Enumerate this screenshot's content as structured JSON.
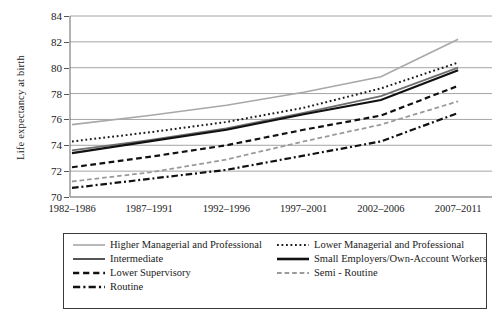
{
  "chart_data": {
    "type": "line",
    "title": "",
    "xlabel": "",
    "ylabel": "Life expectancy at birth",
    "categories": [
      "1982–1986",
      "1987–1991",
      "1992–1996",
      "1997–2001",
      "2002–2006",
      "2007–2011"
    ],
    "ylim": [
      70,
      84
    ],
    "yticks": [
      70,
      72,
      74,
      76,
      78,
      80,
      82,
      84
    ],
    "grid": true,
    "legend_position": "bottom",
    "series": [
      {
        "name": "Higher Managerial and Professional",
        "style": "solid",
        "color": "#a8a8a8",
        "width": 1.6,
        "values": [
          75.6,
          76.3,
          77.1,
          78.1,
          79.3,
          82.2
        ]
      },
      {
        "name": "Lower Managerial and Professional",
        "style": "dotted",
        "color": "#1a1a1a",
        "width": 2.0,
        "values": [
          74.3,
          75.0,
          75.8,
          76.9,
          78.4,
          80.4
        ]
      },
      {
        "name": "Intermediate",
        "style": "solid",
        "color": "#6e6e6e",
        "width": 1.8,
        "values": [
          73.6,
          74.4,
          75.3,
          76.5,
          77.8,
          80.0
        ]
      },
      {
        "name": "Small Employers/Own-Account Workers",
        "style": "solid",
        "color": "#111111",
        "width": 2.2,
        "values": [
          73.4,
          74.3,
          75.2,
          76.4,
          77.5,
          79.8
        ]
      },
      {
        "name": "Lower Supervisory",
        "style": "dashed",
        "color": "#111111",
        "width": 2.2,
        "values": [
          72.3,
          73.1,
          74.0,
          75.2,
          76.3,
          78.6
        ]
      },
      {
        "name": "Semi - Routine",
        "style": "dashed",
        "color": "#9a9a9a",
        "width": 1.8,
        "values": [
          71.2,
          71.9,
          72.9,
          74.3,
          75.6,
          77.4
        ]
      },
      {
        "name": "Routine",
        "style": "dashdot",
        "color": "#111111",
        "width": 2.2,
        "values": [
          70.7,
          71.4,
          72.1,
          73.2,
          74.3,
          76.5
        ]
      }
    ]
  },
  "legend": {
    "items": [
      {
        "label": "Higher Managerial and Professional",
        "style": "solid",
        "color": "#a8a8a8",
        "width": 1.6,
        "column": 0
      },
      {
        "label": "Lower Managerial and Professional",
        "style": "dotted",
        "color": "#1a1a1a",
        "width": 2.0,
        "column": 1
      },
      {
        "label": "Intermediate",
        "style": "solid",
        "color": "#555555",
        "width": 2.0,
        "column": 0
      },
      {
        "label": "Small Employers/Own-Account Workers",
        "style": "solid",
        "color": "#111111",
        "width": 2.6,
        "column": 1
      },
      {
        "label": "Lower Supervisory",
        "style": "dashed",
        "color": "#111111",
        "width": 2.4,
        "column": 0
      },
      {
        "label": "Semi - Routine",
        "style": "dashed",
        "color": "#9a9a9a",
        "width": 1.8,
        "column": 1
      },
      {
        "label": "Routine",
        "style": "dashdot",
        "color": "#111111",
        "width": 2.4,
        "column": 0
      }
    ]
  }
}
